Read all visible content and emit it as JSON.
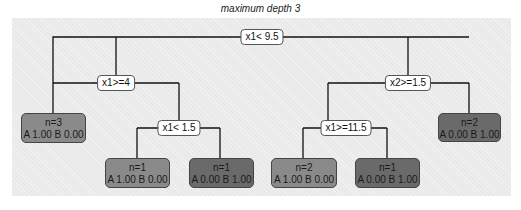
{
  "title": "maximum depth 3",
  "colors": {
    "panel_bg": "#e9e9e9",
    "leaf_class_A": "#8a8a8a",
    "leaf_class_B": "#6a6a6a",
    "edge": "#111111"
  },
  "tree": {
    "root": {
      "label": "x1< 9.5"
    },
    "left": {
      "label": "x1>=4"
    },
    "right": {
      "label": "x2>=1.5"
    },
    "left_right": {
      "label": "x1< 1.5"
    },
    "right_left": {
      "label": "x1>=11.5"
    },
    "leaves": [
      {
        "n": "n=3",
        "probs": "A 1.00  B 0.00",
        "class": "A"
      },
      {
        "n": "n=1",
        "probs": "A 1.00  B 0.00",
        "class": "A"
      },
      {
        "n": "n=1",
        "probs": "A 0.00  B 1.00",
        "class": "B"
      },
      {
        "n": "n=2",
        "probs": "A 1.00  B 0.00",
        "class": "A"
      },
      {
        "n": "n=1",
        "probs": "A 0.00  B 1.00",
        "class": "B"
      },
      {
        "n": "n=2",
        "probs": "A 0.00  B 1.00",
        "class": "B"
      }
    ]
  }
}
